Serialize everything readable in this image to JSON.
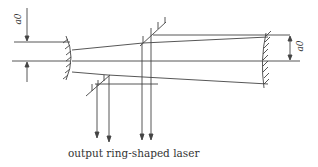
{
  "diagram": {
    "labels": {
      "caption": "output ring-shaped laser",
      "left_dimension": "a0",
      "right_dimension": "a0"
    },
    "components": [
      "concave-mirror-left",
      "convex-mirror-right",
      "scraper-mirror-upper",
      "scraper-mirror-lower",
      "output-beams"
    ],
    "colors": {
      "line": "#444444",
      "background": "#ffffff"
    }
  }
}
